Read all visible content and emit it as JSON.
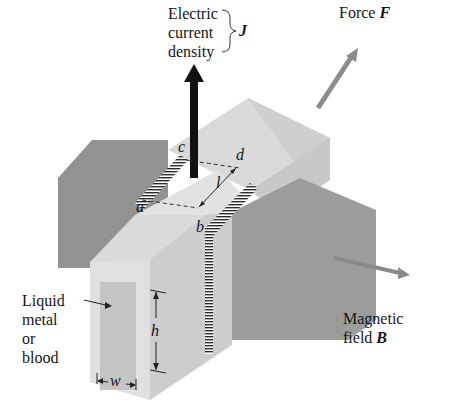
{
  "diagram": {
    "labels": {
      "current": {
        "lines": [
          "Electric",
          "current",
          "density"
        ],
        "symbol": "J"
      },
      "force": {
        "text": "Force",
        "symbol": "F"
      },
      "field": {
        "lines": [
          "Magnetic",
          "field"
        ],
        "symbol": "B"
      },
      "fluid": {
        "lines": [
          "Liquid",
          "metal",
          "or",
          "blood"
        ]
      },
      "points": {
        "a": "a",
        "b": "b",
        "c": "c",
        "d": "d"
      },
      "length": "l",
      "height": "h",
      "width": "w"
    },
    "colors": {
      "magnet_dark": "#8e8e8e",
      "magnet_mid": "#9b9b9b",
      "channel_light": "#dcdcdc",
      "channel_top": "#e4e4e4",
      "channel_side": "#c9c9c9",
      "fluid_window": "#c4c4c4",
      "arrow_black": "#111111",
      "arrow_gray": "#8a8a8a"
    }
  }
}
